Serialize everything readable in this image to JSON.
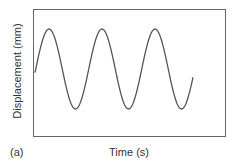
{
  "chart_data": {
    "type": "line",
    "title": "",
    "panel_label": "(a)",
    "xlabel": "Time (s)",
    "ylabel": "Displacement (mm)",
    "grid": false,
    "legend": null,
    "ticks": false,
    "series": [
      {
        "name": "displacement",
        "shape": "sine",
        "cycles": 2.95,
        "start_phase": "midline-rising",
        "x_pixels": [
          35,
          49,
          74,
          102,
          127,
          153,
          180,
          193
        ],
        "y_pixels": [
          68,
          29,
          109,
          29,
          109,
          29,
          109,
          68
        ],
        "points_labels": [
          "start",
          "peak1",
          "trough1",
          "peak2",
          "trough2",
          "peak3",
          "trough3",
          "end"
        ]
      }
    ],
    "colors": {
      "line": "#555555",
      "frame": "#666666"
    }
  }
}
